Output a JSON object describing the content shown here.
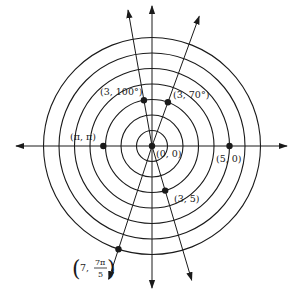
{
  "diagram": {
    "type": "polar-grid",
    "center_px": [
      152,
      146
    ],
    "unit_px": 15.5,
    "circle_radii": [
      1,
      2,
      3,
      4,
      5,
      6,
      7
    ],
    "stroke_color": "#1a1a1a",
    "axes": {
      "horizontal": {
        "from_x": 16,
        "to_x": 287
      },
      "vertical": {
        "from_y": 6,
        "to_y": 288
      }
    },
    "rays": [
      {
        "name": "ray-100deg",
        "angle_deg": 100,
        "length_px": 138
      },
      {
        "name": "ray-70deg",
        "angle_deg": 70,
        "length_px": 138
      },
      {
        "name": "ray-5rad",
        "angle_deg": 286.48,
        "length_px": 140
      },
      {
        "name": "ray-7pi-over-5",
        "angle_deg": 252,
        "length_px": 140
      }
    ],
    "points": [
      {
        "name": "point-origin",
        "r": 0,
        "theta_deg": 0,
        "label": "(0, 0)",
        "label_x": 156,
        "label_y": 157
      },
      {
        "name": "point-5-0",
        "r": 5,
        "theta_deg": 0,
        "label": "(5, 0)",
        "label_x": 216,
        "label_y": 162
      },
      {
        "name": "point-pi-pi",
        "r": 3.14159,
        "theta_deg": 180,
        "label": "(π, π)",
        "label_x": 70,
        "label_y": 140
      },
      {
        "name": "point-3-100deg",
        "r": 3,
        "theta_deg": 100,
        "label": "(3, 100°)",
        "label_x": 100,
        "label_y": 95
      },
      {
        "name": "point-3-70deg",
        "r": 3,
        "theta_deg": 70,
        "label": "(3, 70°)",
        "label_x": 173,
        "label_y": 98
      },
      {
        "name": "point-3-5rad",
        "r": 3,
        "theta_deg": 286.48,
        "label": "(3, 5)",
        "label_x": 174,
        "label_y": 202
      },
      {
        "name": "point-7-7pi-over-5",
        "r": 7,
        "theta_deg": 252,
        "label": "",
        "label_x": 0,
        "label_y": 0
      }
    ],
    "fraction_label": {
      "open": "(",
      "prefix": "7, ",
      "numerator": "7π",
      "denominator": "5",
      "close": ")"
    }
  }
}
